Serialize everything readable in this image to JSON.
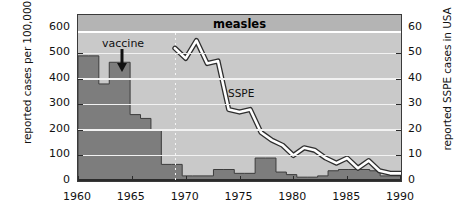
{
  "chart_data": {
    "type": "bar",
    "title": "measles",
    "xlabel": "",
    "ylabel": "reported cases per 100,000 population",
    "ylabel_right": "reported SSPE cases in USA",
    "xlim": [
      1960,
      1990
    ],
    "ylim": [
      0,
      650
    ],
    "ylim_right": [
      0,
      65
    ],
    "xticks": [
      "1960",
      "1965",
      "1970",
      "1975",
      "1980",
      "1985",
      "1990"
    ],
    "yticks_left": [
      "0",
      "100",
      "200",
      "300",
      "400",
      "500",
      "600"
    ],
    "yticks_right": [
      "0",
      "10",
      "20",
      "30",
      "40",
      "50",
      "60"
    ],
    "grid": true,
    "legend": "none",
    "annotations": [
      {
        "name": "vaccine",
        "text": "vaccine",
        "x": 1963,
        "marker": "down-arrow"
      },
      {
        "name": "sspe",
        "text": "SSPE",
        "x": 1975,
        "y_right": 33
      },
      {
        "name": "sspe-start-line",
        "text": "",
        "x": 1969,
        "style": "dotted-vertical"
      }
    ],
    "series": [
      {
        "name": "reported measles cases per 100,000 population",
        "type": "bar",
        "axis": "left",
        "x": [
          1960,
          1961,
          1962,
          1963,
          1964,
          1965,
          1966,
          1967,
          1968,
          1969,
          1970,
          1971,
          1972,
          1973,
          1974,
          1975,
          1976,
          1977,
          1978,
          1979,
          1980,
          1981,
          1982,
          1983,
          1984,
          1985,
          1986,
          1987,
          1988,
          1989,
          1990
        ],
        "values": [
          490,
          490,
          380,
          465,
          465,
          260,
          245,
          200,
          65,
          65,
          20,
          20,
          20,
          45,
          45,
          30,
          30,
          90,
          90,
          35,
          25,
          15,
          15,
          20,
          40,
          45,
          45,
          45,
          40,
          20,
          20
        ]
      },
      {
        "name": "reported SSPE cases in USA",
        "type": "line",
        "axis": "right",
        "x": [
          1969,
          1970,
          1971,
          1972,
          1973,
          1974,
          1975,
          1976,
          1977,
          1978,
          1979,
          1980,
          1981,
          1982,
          1983,
          1984,
          1985,
          1986,
          1987,
          1988,
          1989,
          1990
        ],
        "values": [
          52,
          48,
          55,
          46,
          47,
          28,
          27,
          28,
          19,
          16,
          14,
          10,
          13,
          12,
          9,
          7,
          9,
          5,
          8,
          4,
          3,
          3
        ]
      }
    ]
  },
  "axes": {
    "left_title": "reported cases per 100,000 population",
    "right_title": "reported SSPE cases in USA"
  },
  "labels": {
    "title": "measles",
    "vaccine": "vaccine",
    "sspe": "SSPE"
  }
}
